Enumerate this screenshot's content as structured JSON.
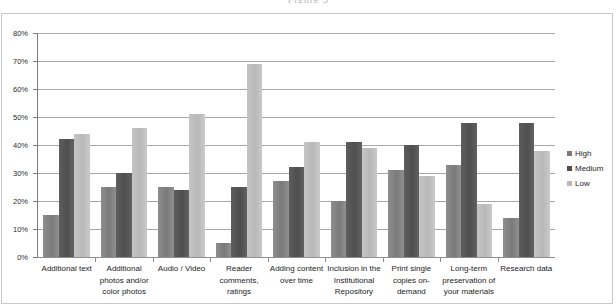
{
  "caption": "Figure 3",
  "legend": {
    "position": "right",
    "entries": [
      {
        "label": "High",
        "color": "#7a7a7a"
      },
      {
        "label": "Medium",
        "color": "#4e4e4e"
      },
      {
        "label": "Low",
        "color": "#b8b8b8"
      }
    ]
  },
  "chart_data": {
    "type": "bar",
    "title": "",
    "subtitle": "",
    "xlabel": "",
    "ylabel": "",
    "ylim": [
      0,
      80
    ],
    "ytick_step": 10,
    "ytick_labels": [
      "0%",
      "10%",
      "20%",
      "30%",
      "40%",
      "50%",
      "60%",
      "70%",
      "80%"
    ],
    "grid": true,
    "value_unit": "%",
    "categories": [
      "Additional text",
      "Additional photos and/or color photos",
      "Audio / Video",
      "Reader comments, ratings",
      "Adding content over time",
      "Inclusion in the Institutional Repository",
      "Print single copies on-demand",
      "Long-term preservation of your materials",
      "Research data"
    ],
    "category_lines": [
      [
        "Additional text"
      ],
      [
        "Additional",
        "photos and/or",
        "color photos"
      ],
      [
        "Audio / Video"
      ],
      [
        "Reader",
        "comments,",
        "ratings"
      ],
      [
        "Adding content",
        "over time"
      ],
      [
        "Inclusion in the",
        "Institutional",
        "Repository"
      ],
      [
        "Print single",
        "copies on-",
        "demand"
      ],
      [
        "Long-term",
        "preservation of",
        "your materials"
      ],
      [
        "Research data"
      ]
    ],
    "series": [
      {
        "name": "High",
        "color": "#7a7a7a",
        "values": [
          15,
          25,
          25,
          5,
          27,
          20,
          31,
          33,
          14
        ]
      },
      {
        "name": "Medium",
        "color": "#4e4e4e",
        "values": [
          42,
          30,
          24,
          25,
          32,
          41,
          40,
          48,
          48
        ]
      },
      {
        "name": "Low",
        "color": "#b8b8b8",
        "values": [
          44,
          46,
          51,
          69,
          41,
          39,
          29,
          19,
          38
        ]
      }
    ]
  }
}
